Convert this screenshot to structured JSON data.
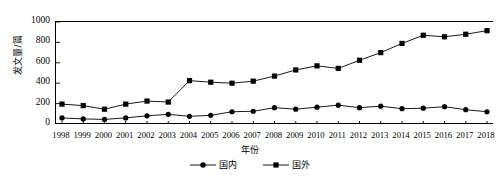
{
  "chart_data": {
    "type": "line",
    "title": "",
    "xlabel": "年份",
    "ylabel": "发文量/篇",
    "x": [
      1998,
      1999,
      2000,
      2001,
      2002,
      2003,
      2004,
      2005,
      2006,
      2007,
      2008,
      2009,
      2010,
      2011,
      2012,
      2013,
      2014,
      2015,
      2016,
      2017,
      2018
    ],
    "xtick_labels": [
      "1998",
      "1999",
      "2000",
      "2001",
      "2002",
      "2003",
      "2004",
      "2005",
      "2006",
      "2007",
      "2008",
      "2009",
      "2010",
      "2011",
      "2012",
      "2013",
      "2014",
      "2015",
      "2016",
      "2017",
      "2018"
    ],
    "ytick_labels": [
      "0",
      "200",
      "400",
      "600",
      "800",
      "1000"
    ],
    "yticks": [
      0,
      200,
      400,
      600,
      800,
      1000
    ],
    "ylim": [
      0,
      1000
    ],
    "xlim": [
      1998,
      2018
    ],
    "grid": false,
    "legend_position": "bottom-center",
    "series": [
      {
        "name": "国内",
        "marker": "circle",
        "color": "#000000",
        "values": [
          60,
          50,
          45,
          60,
          80,
          95,
          75,
          85,
          120,
          125,
          160,
          145,
          165,
          185,
          160,
          175,
          150,
          155,
          170,
          140,
          120
        ]
      },
      {
        "name": "国外",
        "marker": "square",
        "color": "#000000",
        "values": [
          195,
          180,
          145,
          195,
          225,
          215,
          425,
          410,
          400,
          420,
          470,
          530,
          570,
          545,
          625,
          700,
          790,
          870,
          855,
          880,
          915
        ]
      }
    ]
  },
  "legend": {
    "items": [
      {
        "label": "国内",
        "marker": "circle"
      },
      {
        "label": "国外",
        "marker": "square"
      }
    ]
  }
}
